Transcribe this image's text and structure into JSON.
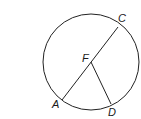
{
  "figure": {
    "circle": {
      "cx": 91,
      "cy": 62,
      "r": 48,
      "stroke": "#222222"
    },
    "center": {
      "label": "F",
      "x": 91,
      "y": 65
    },
    "points": [
      {
        "label": "C",
        "x": 118,
        "y": 27
      },
      {
        "label": "A",
        "x": 62,
        "y": 100
      },
      {
        "label": "D",
        "x": 111,
        "y": 104
      }
    ],
    "segments": [
      {
        "name": "diameter-AC",
        "from": "A",
        "to": "C"
      },
      {
        "name": "radius-FD",
        "from": "F",
        "to": "D"
      }
    ]
  },
  "labels": {
    "C": "C",
    "F": "F",
    "A": "A",
    "D": "D"
  }
}
